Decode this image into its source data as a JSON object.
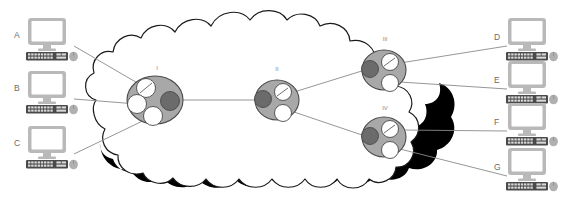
{
  "diagram": {
    "type": "network-topology-cloud",
    "title": "",
    "cloud": {
      "name": "network-cloud",
      "fill": "#ffffff",
      "stroke": "#1a1a1a",
      "shadow_color": "#000000"
    },
    "hosts": [
      {
        "id": "A",
        "label": "A",
        "side": "left",
        "x": 50,
        "y": 38,
        "label_x": 16,
        "label_y": 36
      },
      {
        "id": "B",
        "label": "B",
        "side": "left",
        "x": 50,
        "y": 89,
        "label_x": 16,
        "label_y": 87
      },
      {
        "id": "C",
        "label": "C",
        "side": "left",
        "x": 50,
        "y": 145,
        "label_x": 16,
        "label_y": 143
      },
      {
        "id": "D",
        "label": "D",
        "side": "right",
        "x": 528,
        "y": 38,
        "label_x": 497,
        "label_y": 38
      },
      {
        "id": "E",
        "label": "E",
        "side": "right",
        "x": 528,
        "y": 78,
        "label_x": 497,
        "label_y": 80
      },
      {
        "id": "F",
        "label": "F",
        "side": "right",
        "x": 528,
        "y": 122,
        "label_x": 497,
        "label_y": 122
      },
      {
        "id": "G",
        "label": "G",
        "side": "right",
        "x": 528,
        "y": 168,
        "label_x": 497,
        "label_y": 166
      }
    ],
    "nodes": [
      {
        "id": "I",
        "label": "I",
        "cx": 155,
        "cy": 100,
        "rx": 28,
        "ry": 24,
        "label_x": 157,
        "label_y": 68,
        "disks": [
          {
            "cx": 146,
            "cy": 88,
            "r": 9.5,
            "fill": "#ffffff",
            "slash": true
          },
          {
            "cx": 137,
            "cy": 104,
            "r": 9.5,
            "fill": "#ffffff",
            "slash": false
          },
          {
            "cx": 153,
            "cy": 116,
            "r": 9.5,
            "fill": "#ffffff",
            "slash": false
          },
          {
            "cx": 170,
            "cy": 101,
            "r": 9.5,
            "fill": "#6b6b6b",
            "slash": false
          }
        ]
      },
      {
        "id": "II",
        "label": "II",
        "cx": 277,
        "cy": 100,
        "rx": 22,
        "ry": 20,
        "label_x": 277,
        "label_y": 69,
        "disks": [
          {
            "cx": 263,
            "cy": 99,
            "r": 8.5,
            "fill": "#6b6b6b",
            "slash": false
          },
          {
            "cx": 283,
            "cy": 92,
            "r": 8.5,
            "fill": "#ffffff",
            "slash": true
          },
          {
            "cx": 283,
            "cy": 113,
            "r": 8.5,
            "fill": "#ffffff",
            "slash": false
          }
        ]
      },
      {
        "id": "III",
        "label": "III",
        "cx": 384,
        "cy": 70,
        "rx": 22,
        "ry": 20,
        "label_x": 385,
        "label_y": 39,
        "disks": [
          {
            "cx": 370,
            "cy": 69,
            "r": 8.5,
            "fill": "#6b6b6b",
            "slash": false
          },
          {
            "cx": 390,
            "cy": 62,
            "r": 8.5,
            "fill": "#ffffff",
            "slash": true
          },
          {
            "cx": 390,
            "cy": 83,
            "r": 8.5,
            "fill": "#ffffff",
            "slash": false
          }
        ]
      },
      {
        "id": "IV",
        "label": "IV",
        "cx": 384,
        "cy": 137,
        "rx": 22,
        "ry": 20,
        "label_x": 385,
        "label_y": 108,
        "disks": [
          {
            "cx": 370,
            "cy": 136,
            "r": 8.5,
            "fill": "#6b6b6b",
            "slash": false
          },
          {
            "cx": 390,
            "cy": 129,
            "r": 8.5,
            "fill": "#ffffff",
            "slash": true
          },
          {
            "cx": 390,
            "cy": 150,
            "r": 8.5,
            "fill": "#ffffff",
            "slash": false
          }
        ]
      }
    ],
    "links": [
      {
        "from": "A",
        "to": "I",
        "x1": 74,
        "y1": 46,
        "x2": 146,
        "y2": 88
      },
      {
        "from": "B",
        "to": "I",
        "x1": 74,
        "y1": 99,
        "x2": 137,
        "y2": 104
      },
      {
        "from": "C",
        "to": "I",
        "x1": 74,
        "y1": 154,
        "x2": 153,
        "y2": 116
      },
      {
        "from": "I",
        "to": "II",
        "x1": 180,
        "y1": 100,
        "x2": 258,
        "y2": 100
      },
      {
        "from": "II",
        "to": "III",
        "x1": 294,
        "y1": 92,
        "x2": 365,
        "y2": 70
      },
      {
        "from": "II",
        "to": "IV",
        "x1": 294,
        "y1": 112,
        "x2": 365,
        "y2": 136
      },
      {
        "from": "III",
        "to": "D",
        "x1": 400,
        "y1": 63,
        "x2": 507,
        "y2": 46
      },
      {
        "from": "III",
        "to": "E",
        "x1": 400,
        "y1": 82,
        "x2": 507,
        "y2": 89
      },
      {
        "from": "IV",
        "to": "F",
        "x1": 400,
        "y1": 130,
        "x2": 507,
        "y2": 131
      },
      {
        "from": "IV",
        "to": "G",
        "x1": 400,
        "y1": 149,
        "x2": 507,
        "y2": 176
      }
    ],
    "colors": {
      "node_fill": "#a8a8a8",
      "node_stroke": "#4a4a4a",
      "disk_white": "#ffffff",
      "disk_dark": "#6b6b6b",
      "disk_stroke": "#4a4a4a",
      "link_stroke": "#8a8a8a",
      "monitor_frame": "#b9b9b9",
      "monitor_screen": "#ffffff",
      "keyboard_body": "#4a4a4a",
      "keyboard_key": "#d9d9d9",
      "mouse_fill": "#b0b0b0",
      "label_text": "#6b6b6b",
      "node_label_text": "#8a8a8a"
    }
  }
}
